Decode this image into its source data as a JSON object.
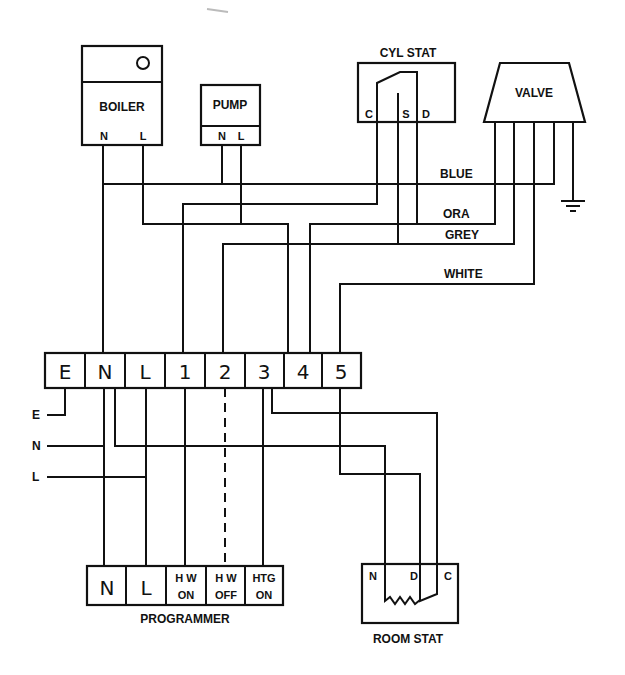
{
  "diagram": {
    "components": {
      "boiler": {
        "label": "BOILER",
        "terminals": [
          "N",
          "L"
        ],
        "indicator": "circle"
      },
      "pump": {
        "label": "PUMP",
        "terminals": [
          "N",
          "L"
        ]
      },
      "cyl_stat": {
        "label": "CYL STAT",
        "terminals": [
          "C",
          "S",
          "D"
        ]
      },
      "valve": {
        "label": "VALVE"
      },
      "programmer": {
        "label": "PROGRAMMER",
        "terminals": [
          "N",
          "L",
          "H W",
          "ON",
          "H W",
          "OFF",
          "HTG",
          "ON"
        ]
      },
      "room_stat": {
        "label": "ROOM STAT",
        "terminals": [
          "N",
          "D",
          "C"
        ]
      }
    },
    "terminal_strip": [
      "E",
      "N",
      "L",
      "1",
      "2",
      "3",
      "4",
      "5"
    ],
    "supply": [
      "E",
      "N",
      "L"
    ],
    "wire_colors": [
      "BLUE",
      "ORA",
      "GREY",
      "WHITE"
    ],
    "ground": "earth-symbol"
  }
}
